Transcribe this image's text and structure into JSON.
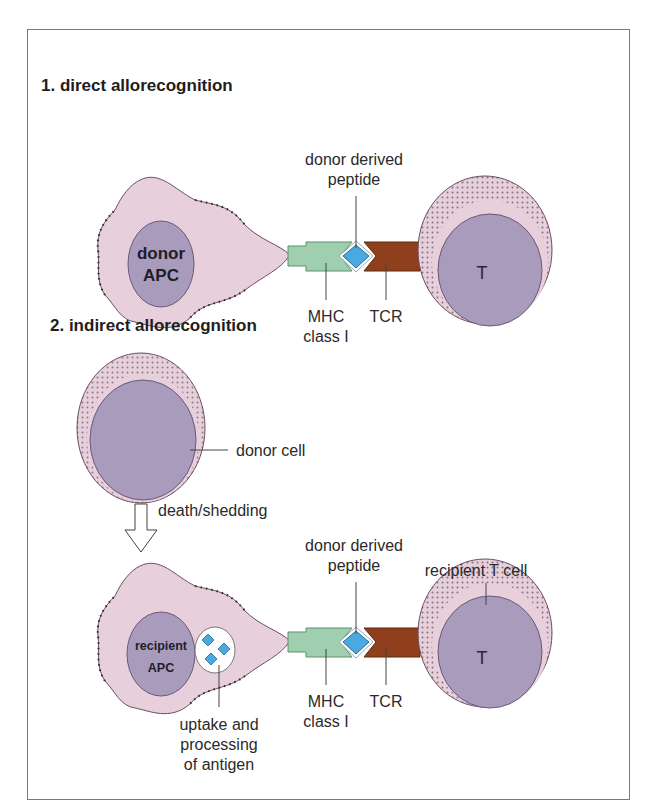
{
  "panel_1": {
    "title": "1. direct allorecognition",
    "apc_label_line1": "donor",
    "apc_label_line2": "APC",
    "peptide_label_line1": "donor derived",
    "peptide_label_line2": "peptide",
    "mhc_label_line1": "MHC",
    "mhc_label_line2": "class I",
    "tcr_label": "TCR",
    "t_cell_label": "T"
  },
  "panel_2": {
    "title": "2. indirect allorecognition",
    "donor_cell_label": "donor cell",
    "arrow_label": "death/shedding",
    "apc_label_line1": "recipient",
    "apc_label_line2": "APC",
    "peptide_label_line1": "donor derived",
    "peptide_label_line2": "peptide",
    "mhc_label_line1": "MHC",
    "mhc_label_line2": "class I",
    "tcr_label": "TCR",
    "t_cell_label": "T",
    "recipient_t_cell_label": "recipient T cell",
    "uptake_label_line1": "uptake and",
    "uptake_label_line2": "processing",
    "uptake_label_line3": "of antigen"
  },
  "colors": {
    "cell_cytoplasm": "#e7cfdc",
    "nucleus": "#a99bbb",
    "mhc": "#9fcfae",
    "tcr": "#8f3f1c",
    "peptide": "#4aa9e0",
    "frame_border": "#7a7a7a"
  }
}
